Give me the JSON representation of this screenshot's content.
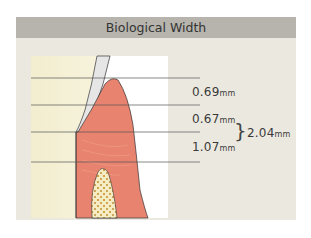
{
  "title": "Biological Width",
  "measurements": [
    {
      "value": "0.69",
      "unit": "mm"
    },
    {
      "value": "0.67",
      "unit": "mm"
    },
    {
      "value": "1.07",
      "unit": "mm"
    }
  ],
  "total": {
    "value": "2.04",
    "unit": "mm"
  },
  "colors": {
    "header_bg": "#b6b4ad",
    "panel_bg": "#ebe9df",
    "tooth": "#f4efcf",
    "gingiva": "#e7836f",
    "bone": "#f3e6b8"
  }
}
